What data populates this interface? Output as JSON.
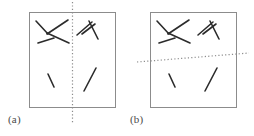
{
  "figure": {
    "width": 254,
    "height": 136,
    "background": "#ffffff",
    "stroke_color_segments": "#2b2b2b",
    "stroke_color_box": "#8c8c8c",
    "stroke_color_divider": "#8c8c8c",
    "segment_stroke_width": 1.6,
    "box_stroke_width": 1.0,
    "divider_stroke_width": 1.2,
    "divider_dash_pattern": "1.2 2.2"
  },
  "panels": [
    {
      "id": "a",
      "label": "(a)",
      "box": {
        "x": 29,
        "y": 12,
        "width": 86,
        "height": 95
      },
      "divider": {
        "type": "vertical",
        "x1": 72.5,
        "y1": 2,
        "x2": 72.5,
        "y2": 123
      },
      "segments": [
        {
          "name": "upper-left-cluster-diagonal-down",
          "x1": 36,
          "y1": 21,
          "x2": 48,
          "y2": 34
        },
        {
          "name": "upper-left-cluster-long-upper",
          "x1": 47,
          "y1": 34,
          "x2": 68,
          "y2": 20
        },
        {
          "name": "upper-left-cluster-long-lower",
          "x1": 47,
          "y1": 33,
          "x2": 69,
          "y2": 43
        },
        {
          "name": "upper-left-cluster-short-base",
          "x1": 38,
          "y1": 43,
          "x2": 54,
          "y2": 38
        },
        {
          "name": "upper-right-cluster-left-arm",
          "x1": 77,
          "y1": 35,
          "x2": 92,
          "y2": 22
        },
        {
          "name": "upper-right-cluster-mid-arm",
          "x1": 82,
          "y1": 34,
          "x2": 95,
          "y2": 24
        },
        {
          "name": "upper-right-cluster-right-arm",
          "x1": 89,
          "y1": 21,
          "x2": 98,
          "y2": 39
        },
        {
          "name": "lower-left-isolated",
          "x1": 48,
          "y1": 74,
          "x2": 54,
          "y2": 87
        },
        {
          "name": "lower-right-isolated",
          "x1": 96,
          "y1": 68,
          "x2": 84,
          "y2": 91
        }
      ]
    },
    {
      "id": "b",
      "label": "(b)",
      "box": {
        "x": 150,
        "y": 12,
        "width": 86,
        "height": 95
      },
      "divider": {
        "type": "diagonal",
        "x1": 137,
        "y1": 62,
        "x2": 249,
        "y2": 53
      },
      "segments": [
        {
          "name": "upper-left-cluster-diagonal-down",
          "x1": 157,
          "y1": 21,
          "x2": 169,
          "y2": 34
        },
        {
          "name": "upper-left-cluster-long-upper",
          "x1": 168,
          "y1": 34,
          "x2": 189,
          "y2": 20
        },
        {
          "name": "upper-left-cluster-long-lower",
          "x1": 168,
          "y1": 33,
          "x2": 190,
          "y2": 43
        },
        {
          "name": "upper-left-cluster-short-base",
          "x1": 159,
          "y1": 43,
          "x2": 175,
          "y2": 38
        },
        {
          "name": "upper-right-cluster-left-arm",
          "x1": 198,
          "y1": 35,
          "x2": 213,
          "y2": 22
        },
        {
          "name": "upper-right-cluster-mid-arm",
          "x1": 203,
          "y1": 34,
          "x2": 216,
          "y2": 24
        },
        {
          "name": "upper-right-cluster-right-arm",
          "x1": 210,
          "y1": 21,
          "x2": 219,
          "y2": 39
        },
        {
          "name": "lower-left-isolated",
          "x1": 169,
          "y1": 74,
          "x2": 175,
          "y2": 87
        },
        {
          "name": "lower-right-isolated",
          "x1": 217,
          "y1": 68,
          "x2": 205,
          "y2": 91
        }
      ]
    }
  ]
}
